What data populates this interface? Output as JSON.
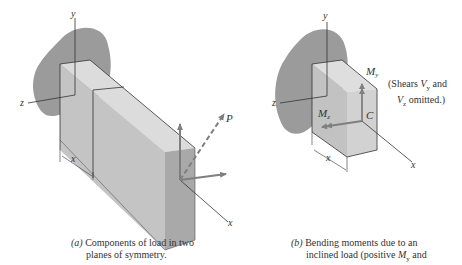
{
  "figure_a": {
    "axis_labels": {
      "y": "y",
      "z": "z",
      "x": "x",
      "x_dim": "x"
    },
    "load_label": "P",
    "caption_part": "(a)",
    "caption_line1": " Components of load in two",
    "caption_line2": "planes of symmetry."
  },
  "figure_b": {
    "axis_labels": {
      "y": "y",
      "z": "z",
      "x": "x",
      "x_dim": "x"
    },
    "moment_y": "M",
    "moment_y_sub": "y",
    "moment_z": "M",
    "moment_z_sub": "z",
    "centroid_label": "C",
    "note_line1_prefix": "(Shears ",
    "note_v": "V",
    "note_vy_sub": "y",
    "note_line1_suffix": " and",
    "note_vz_sub": "z",
    "note_line2_suffix": " omitted.)",
    "caption_part": "(b)",
    "caption_line1": " Bending moments due to an",
    "caption_line2_prefix": "inclined load (positive ",
    "caption_m": "M",
    "caption_m_sub": "y",
    "caption_line2_suffix": " and"
  },
  "colors": {
    "support_blob": "#9b9b9b",
    "beam_top": "#dcdcdc",
    "beam_front": "#c2c2c2",
    "beam_end": "#a8a8a8",
    "arrow": "#7f7f7f",
    "line": "#333333"
  }
}
